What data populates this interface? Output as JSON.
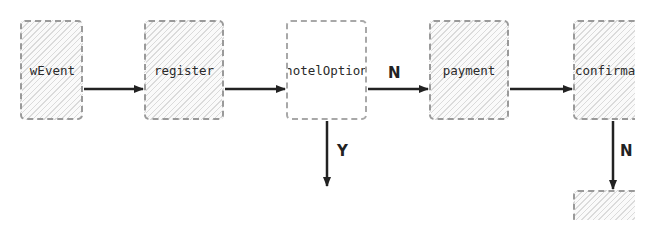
{
  "diagram": {
    "nodes": [
      {
        "id": "newEvent",
        "label": "wEvent",
        "type": "process"
      },
      {
        "id": "register",
        "label": "register",
        "type": "process"
      },
      {
        "id": "hotelOption",
        "label": "hotelOption",
        "type": "decision"
      },
      {
        "id": "payment",
        "label": "payment",
        "type": "process"
      },
      {
        "id": "confirmation",
        "label": "confirmat",
        "type": "process"
      },
      {
        "id": "next",
        "label": "",
        "type": "process"
      }
    ],
    "edges": [
      {
        "from": "newEvent",
        "to": "register",
        "label": ""
      },
      {
        "from": "register",
        "to": "hotelOption",
        "label": ""
      },
      {
        "from": "hotelOption",
        "to": "payment",
        "label": "N"
      },
      {
        "from": "hotelOption",
        "to": "below",
        "label": "Y"
      },
      {
        "from": "payment",
        "to": "confirmation",
        "label": ""
      },
      {
        "from": "confirmation",
        "to": "next",
        "label": "N"
      }
    ],
    "colors": {
      "line": "#222222",
      "border": "#9a9a9a"
    }
  }
}
